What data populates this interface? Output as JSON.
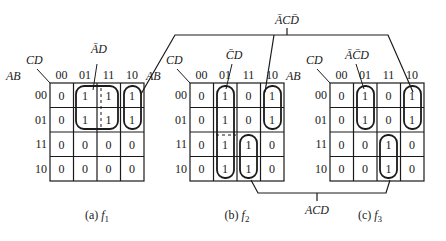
{
  "diagram": {
    "type": "karnaugh-maps",
    "row_var_label": "AB",
    "col_var_label": "CD",
    "col_headers": [
      "00",
      "01",
      "11",
      "10"
    ],
    "row_headers": [
      "00",
      "01",
      "11",
      "10"
    ],
    "maps": [
      {
        "id": "f1",
        "caption": "(a) f1",
        "caption_prefix": "(a)",
        "caption_func": "f",
        "caption_sub": "1",
        "cells": [
          [
            "0",
            "1",
            "1",
            "1"
          ],
          [
            "0",
            "1",
            "1",
            "1"
          ],
          [
            "0",
            "0",
            "0",
            "0"
          ],
          [
            "0",
            "0",
            "0",
            "0"
          ]
        ],
        "groups": [
          {
            "term": "ĀD",
            "rows": [
              0,
              1
            ],
            "cols": [
              1,
              2
            ]
          },
          {
            "term": "ĀCD̄",
            "rows": [
              0,
              1
            ],
            "cols": [
              3
            ]
          }
        ],
        "term_label": "ĀD"
      },
      {
        "id": "f2",
        "caption": "(b) f2",
        "caption_prefix": "(b)",
        "caption_func": "f",
        "caption_sub": "2",
        "cells": [
          [
            "0",
            "1",
            "0",
            "1"
          ],
          [
            "0",
            "1",
            "0",
            "1"
          ],
          [
            "0",
            "1",
            "1",
            "0"
          ],
          [
            "0",
            "1",
            "1",
            "0"
          ]
        ],
        "groups": [
          {
            "term": "C̄D",
            "rows": [
              0,
              1,
              2,
              3
            ],
            "cols": [
              1
            ]
          },
          {
            "term": "ĀCD̄",
            "rows": [
              0,
              1
            ],
            "cols": [
              3
            ]
          },
          {
            "term": "ACD",
            "rows": [
              2,
              3
            ],
            "cols": [
              2
            ]
          }
        ],
        "term_label": "C̄D"
      },
      {
        "id": "f3",
        "caption": "(c) f3",
        "caption_prefix": "(c)",
        "caption_func": "f",
        "caption_sub": "3",
        "cells": [
          [
            "0",
            "1",
            "0",
            "1"
          ],
          [
            "0",
            "1",
            "0",
            "1"
          ],
          [
            "0",
            "0",
            "1",
            "0"
          ],
          [
            "0",
            "0",
            "1",
            "0"
          ]
        ],
        "groups": [
          {
            "term": "ĀC̄D",
            "rows": [
              0,
              1
            ],
            "cols": [
              1
            ]
          },
          {
            "term": "ĀCD̄",
            "rows": [
              0,
              1
            ],
            "cols": [
              3
            ]
          },
          {
            "term": "ACD",
            "rows": [
              2,
              3
            ],
            "cols": [
              2
            ]
          }
        ],
        "term_label": "ĀC̄D"
      }
    ],
    "shared_terms": {
      "top": "ĀCD̄",
      "bottom": "ACD"
    },
    "colors": {
      "ink": "#1a1a1a",
      "background": "#ffffff"
    }
  }
}
